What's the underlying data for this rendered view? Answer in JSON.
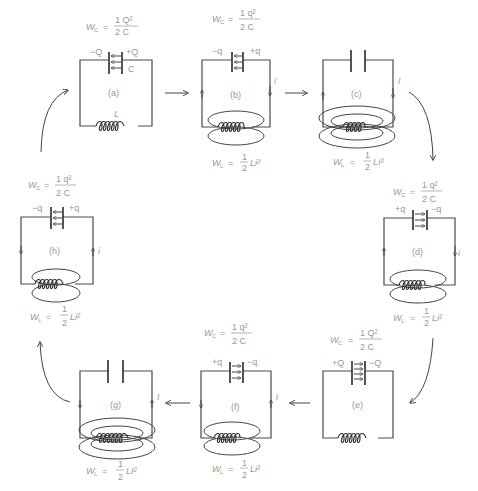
{
  "diagram": {
    "colors": {
      "line": "#4a4a4a",
      "text": "#999999"
    },
    "panels": [
      {
        "id": "a",
        "label": "(a)",
        "energy_eq": {
          "lhs": "W",
          "sub": "C",
          "num": "1 Q²",
          "den": "2 C"
        },
        "left_charge": "−Q",
        "right_charge": "+Q",
        "cap_label": "C",
        "ind_label": "L",
        "current": ""
      },
      {
        "id": "b",
        "label": "(b)",
        "energy_eq": {
          "lhs": "W",
          "sub": "C",
          "num": "1 q²",
          "den": "2 C"
        },
        "left_charge": "−q",
        "right_charge": "+q",
        "current": "i",
        "energy_eq_L": {
          "lhs": "W",
          "sub": "L",
          "num": "1",
          "den": "2",
          "rest": "Li²"
        }
      },
      {
        "id": "c",
        "label": "(c)",
        "current": "I",
        "energy_eq_L": {
          "lhs": "W",
          "sub": "L",
          "num": "1",
          "den": "2",
          "rest": "LI²"
        }
      },
      {
        "id": "d",
        "label": "(d)",
        "energy_eq": {
          "lhs": "W",
          "sub": "C",
          "num": "1 q²",
          "den": "2 C"
        },
        "left_charge": "+q",
        "right_charge": "−q",
        "current": "i",
        "energy_eq_L": {
          "lhs": "W",
          "sub": "L",
          "num": "1",
          "den": "2",
          "rest": "Li²"
        }
      },
      {
        "id": "e",
        "label": "(e)",
        "energy_eq": {
          "lhs": "W",
          "sub": "C",
          "num": "1 Q²",
          "den": "2 C"
        },
        "left_charge": "+Q",
        "right_charge": "−Q"
      },
      {
        "id": "f",
        "label": "(f)",
        "energy_eq": {
          "lhs": "W",
          "sub": "C",
          "num": "1 q²",
          "den": "2 C"
        },
        "left_charge": "+q",
        "right_charge": "−q",
        "current": "i",
        "energy_eq_L": {
          "lhs": "W",
          "sub": "L",
          "num": "1",
          "den": "2",
          "rest": "Li²"
        }
      },
      {
        "id": "g",
        "label": "(g)",
        "current": "I",
        "energy_eq_L": {
          "lhs": "W",
          "sub": "L",
          "num": "1",
          "den": "2",
          "rest": "LI²"
        }
      },
      {
        "id": "h",
        "label": "(h)",
        "energy_eq": {
          "lhs": "W",
          "sub": "C",
          "num": "1 q²",
          "den": "2 C"
        },
        "left_charge": "−q",
        "right_charge": "+q",
        "current": "i",
        "energy_eq_L": {
          "lhs": "W",
          "sub": "L",
          "num": "1",
          "den": "2",
          "rest": "Li²"
        }
      }
    ]
  }
}
